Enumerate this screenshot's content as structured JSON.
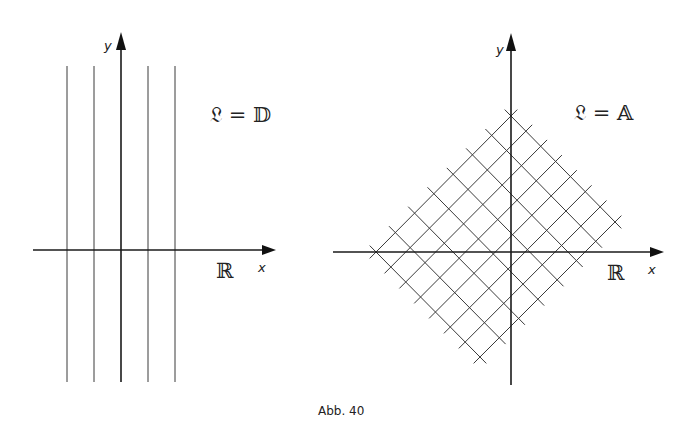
{
  "figure": {
    "caption": "Abb. 40",
    "left_panel": {
      "axis_x_label": "x",
      "axis_y_label": "y",
      "domain_label": "ℝ",
      "formula": "𝔏 = 𝔻",
      "description": "vertical lines parallel to y-axis",
      "vertical_line_count": 5
    },
    "right_panel": {
      "axis_x_label": "x",
      "axis_y_label": "y",
      "domain_label": "ℝ",
      "formula": "𝔏 = 𝔸",
      "description": "diagonal grid of lines at ±45° forming a square lattice",
      "lines_per_direction": 8
    }
  }
}
